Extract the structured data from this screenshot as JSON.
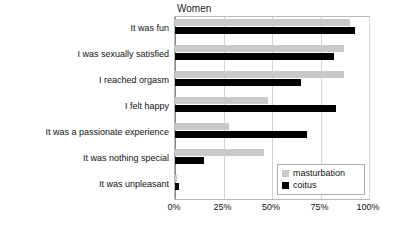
{
  "chart_data": {
    "type": "bar",
    "orientation": "horizontal",
    "title": "Women",
    "xlabel": "",
    "ylabel": "",
    "xlim": [
      0,
      100
    ],
    "xticks": [
      "0%",
      "25%",
      "50%",
      "75%",
      "100%"
    ],
    "xtick_values": [
      0,
      25,
      50,
      75,
      100
    ],
    "grid": true,
    "legend_position": "bottom-right",
    "categories": [
      "It was fun",
      "I was sexually satisfied",
      "I reached orgasm",
      "I felt happy",
      "It was a passionate experience",
      "It was nothing special",
      "It was unpleasant"
    ],
    "series": [
      {
        "name": "masturbation",
        "color": "#c9c9c9",
        "values": [
          90,
          87,
          87,
          48,
          28,
          46,
          1
        ]
      },
      {
        "name": "coitus",
        "color": "#000000",
        "values": [
          93,
          82,
          65,
          83,
          68,
          15,
          2
        ]
      }
    ]
  },
  "legend": {
    "items": [
      {
        "label": "masturbation"
      },
      {
        "label": "coitus"
      }
    ]
  }
}
